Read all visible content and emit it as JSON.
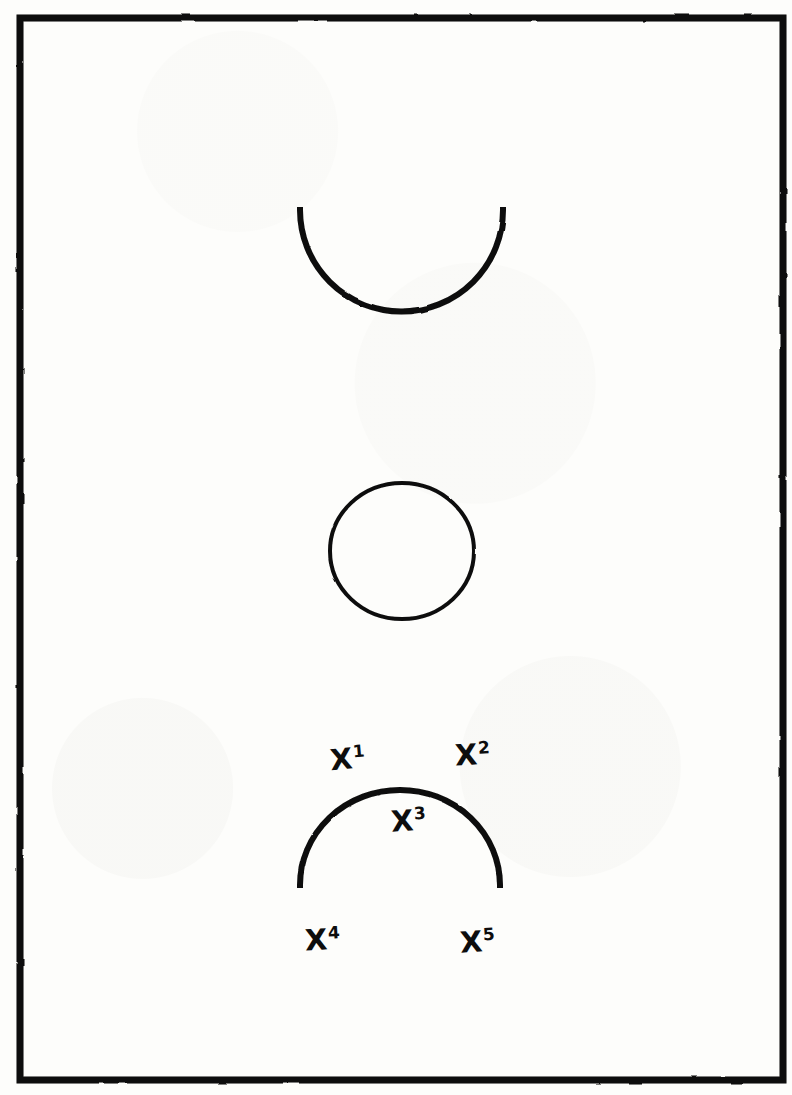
{
  "diagram": {
    "medium": "hand-drawn ink on paper",
    "ink_color": "#0d0d0d",
    "paper_color": "#fdfdfb",
    "orientation": "vertical full court"
  },
  "court": {
    "boundary": {
      "left": 20,
      "top": 18,
      "right": 783,
      "bottom": 1080,
      "stroke_width": 7
    },
    "midcourt_line": {
      "y": 552,
      "stroke_width": 5
    },
    "center_circle": {
      "cx": 402,
      "cy": 551,
      "rx": 72,
      "ry": 68,
      "stroke_width": 4
    },
    "top_key": {
      "lane_left": 300,
      "lane_right": 503,
      "lane_top": 18,
      "free_throw_line_y": 210,
      "arc_bottom_y": 312,
      "stroke_width": 5
    },
    "bottom_key": {
      "lane_left": 300,
      "lane_right": 500,
      "baseline_y": 1080,
      "free_throw_line_y": 885,
      "arc_top_y": 790,
      "stroke_width": 5
    }
  },
  "markers": [
    {
      "id": "marker-1",
      "base": "X",
      "superscript": "1",
      "label": "X1",
      "x": 345,
      "y": 760,
      "position_note": "left wing above the key arc"
    },
    {
      "id": "marker-2",
      "base": "X",
      "superscript": "2",
      "label": "X2",
      "x": 472,
      "y": 757,
      "position_note": "right wing above the key arc"
    },
    {
      "id": "marker-3",
      "base": "X",
      "superscript": "3",
      "label": "X3",
      "x": 408,
      "y": 822,
      "position_note": "high post inside the key arc"
    },
    {
      "id": "marker-4",
      "base": "X",
      "superscript": "4",
      "label": "X4",
      "x": 322,
      "y": 940,
      "position_note": "low post on the left lane line"
    },
    {
      "id": "marker-5",
      "base": "X",
      "superscript": "5",
      "label": "X5",
      "x": 477,
      "y": 943,
      "position_note": "low post on the right lane line"
    }
  ]
}
